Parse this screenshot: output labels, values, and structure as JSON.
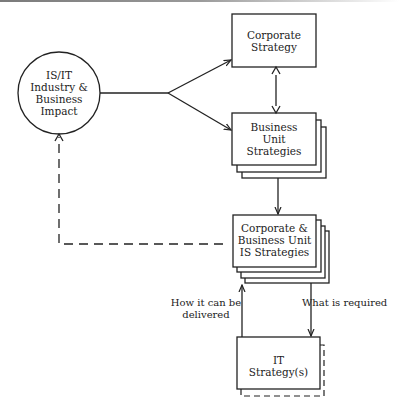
{
  "diagram": {
    "nodes": {
      "impact": {
        "line1": "IS/IT",
        "line2": "Industry &",
        "line3": "Business",
        "line4": "Impact"
      },
      "corporate": {
        "line1": "Corporate",
        "line2": "Strategy"
      },
      "business_unit": {
        "line1": "Business",
        "line2": "Unit",
        "line3": "Strategies"
      },
      "is_strategies": {
        "line1": "Corporate &",
        "line2": "Business Unit",
        "line3": "IS Strategies"
      },
      "it_strategy": {
        "line1": "IT",
        "line2": "Strategy(s)"
      }
    },
    "edge_labels": {
      "how_delivered_1": "How it can be",
      "how_delivered_2": "delivered",
      "what_required": "What is required"
    },
    "colors": {
      "stroke": "#222222",
      "background": "#ffffff"
    }
  }
}
